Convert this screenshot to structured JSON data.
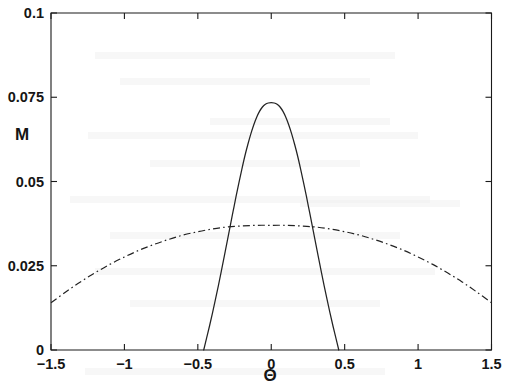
{
  "chart_data": {
    "type": "line",
    "title": "",
    "xlabel": "Θ",
    "ylabel": "M",
    "xlim": [
      -1.5,
      1.5
    ],
    "ylim": [
      0,
      0.1
    ],
    "grid": false,
    "legend": "none",
    "xticks": [
      -1.5,
      -1,
      -0.5,
      0,
      0.5,
      1,
      1.5
    ],
    "xticklabels": [
      "-1.5",
      "-1",
      "-0.5",
      "0",
      "0.5",
      "1",
      "1.5"
    ],
    "yticks": [
      0,
      0.025,
      0.05,
      0.075,
      0.1
    ],
    "yticklabels": [
      "0",
      "0.025",
      "0.05",
      "0.075",
      "0.1"
    ],
    "series": [
      {
        "name": "narrow-peak",
        "style": "solid",
        "color": "#232323",
        "x": [
          -0.46,
          -0.44,
          -0.42,
          -0.4,
          -0.38,
          -0.36,
          -0.34,
          -0.32,
          -0.3,
          -0.28,
          -0.26,
          -0.24,
          -0.22,
          -0.2,
          -0.18,
          -0.16,
          -0.14,
          -0.12,
          -0.1,
          -0.08,
          -0.06,
          -0.04,
          -0.02,
          0.0,
          0.02,
          0.04,
          0.06,
          0.08,
          0.1,
          0.12,
          0.14,
          0.16,
          0.18,
          0.2,
          0.22,
          0.24,
          0.26,
          0.28,
          0.3,
          0.32,
          0.34,
          0.36,
          0.38,
          0.4,
          0.42,
          0.44,
          0.46
        ],
        "y": [
          0.0,
          0.0036,
          0.0072,
          0.011,
          0.015,
          0.0191,
          0.0234,
          0.0278,
          0.0322,
          0.0367,
          0.0411,
          0.0455,
          0.0497,
          0.0537,
          0.0575,
          0.0609,
          0.064,
          0.0667,
          0.069,
          0.0708,
          0.0721,
          0.0729,
          0.0733,
          0.0734,
          0.0733,
          0.0729,
          0.0721,
          0.0708,
          0.069,
          0.0667,
          0.064,
          0.0609,
          0.0575,
          0.0537,
          0.0497,
          0.0455,
          0.0411,
          0.0367,
          0.0322,
          0.0278,
          0.0234,
          0.0191,
          0.015,
          0.011,
          0.0072,
          0.0036,
          0.0
        ]
      },
      {
        "name": "broad-peak",
        "style": "dash-dot",
        "color": "#232323",
        "x": [
          -1.5,
          -1.4,
          -1.3,
          -1.2,
          -1.1,
          -1.0,
          -0.9,
          -0.8,
          -0.7,
          -0.6,
          -0.5,
          -0.4,
          -0.3,
          -0.2,
          -0.1,
          0.0,
          0.1,
          0.2,
          0.3,
          0.4,
          0.5,
          0.6,
          0.7,
          0.8,
          0.9,
          1.0,
          1.1,
          1.2,
          1.3,
          1.4,
          1.5
        ],
        "y": [
          0.014,
          0.0172,
          0.0202,
          0.0229,
          0.0254,
          0.0276,
          0.0296,
          0.0313,
          0.0328,
          0.0341,
          0.0351,
          0.0359,
          0.0365,
          0.0368,
          0.037,
          0.037,
          0.037,
          0.0368,
          0.0365,
          0.0359,
          0.0351,
          0.0341,
          0.0328,
          0.0313,
          0.0296,
          0.0276,
          0.0254,
          0.0229,
          0.0202,
          0.0172,
          0.014
        ]
      }
    ]
  }
}
